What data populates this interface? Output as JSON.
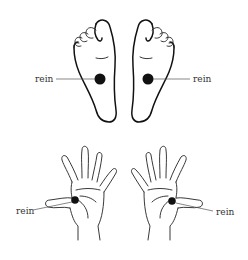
{
  "diagram": {
    "title": "",
    "background": "#ffffff",
    "ink_color": "#111111",
    "point_color": "#111111",
    "feet": {
      "left": {
        "label": "rein",
        "point": "kidney reflex point, center of sole"
      },
      "right": {
        "label": "rein",
        "point": "kidney reflex point, center of sole"
      }
    },
    "hands": {
      "left": {
        "label": "rein",
        "point": "kidney reflex point, base of thumb on palm"
      },
      "right": {
        "label": "rein",
        "point": "kidney reflex point, base of thumb on palm"
      }
    }
  }
}
